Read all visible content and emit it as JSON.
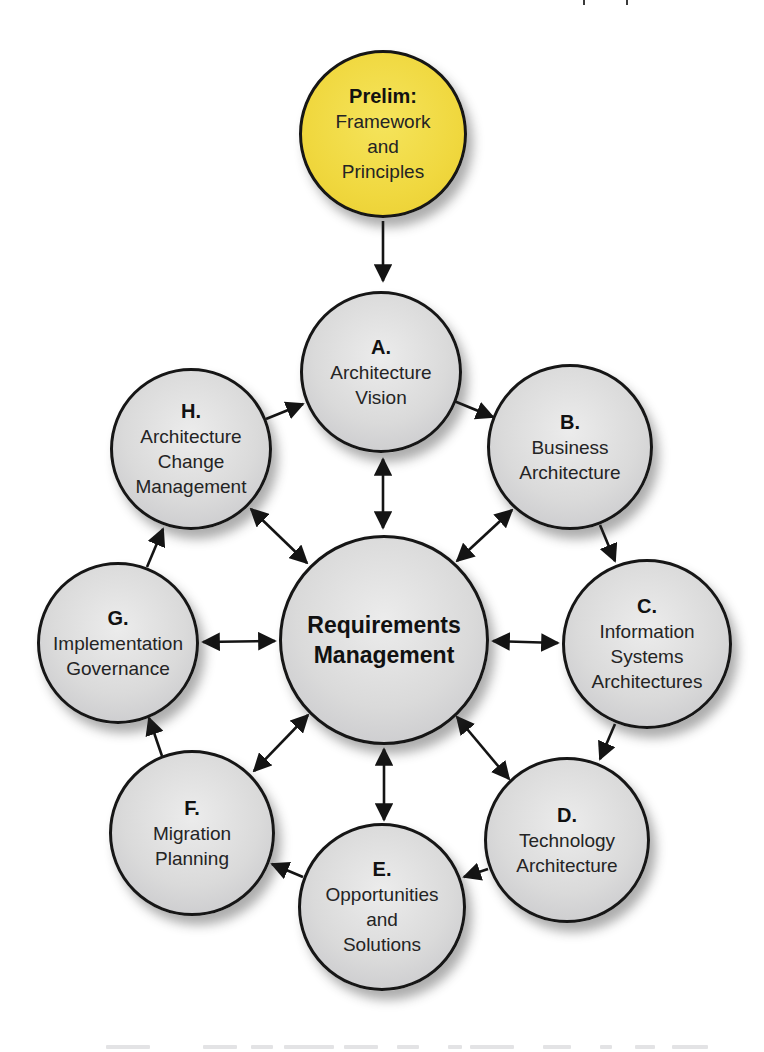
{
  "diagram": {
    "name": "Architecture Development Method cycle",
    "colors": {
      "prelim_fill": "#F0D83F",
      "phase_fill": "#D8D8D8",
      "outline": "#161616",
      "arrow": "#141414",
      "text": "#242424"
    },
    "nodes": {
      "prelim": {
        "title": "Prelim:",
        "line1": "Framework",
        "line2": "and",
        "line3": "Principles"
      },
      "a": {
        "title": "A.",
        "line1": "Architecture",
        "line2": "Vision",
        "line3": ""
      },
      "b": {
        "title": "B.",
        "line1": "Business",
        "line2": "Architecture",
        "line3": ""
      },
      "c": {
        "title": "C.",
        "line1": "Information",
        "line2": "Systems",
        "line3": "Architectures"
      },
      "d": {
        "title": "D.",
        "line1": "Technology",
        "line2": "Architecture",
        "line3": ""
      },
      "e": {
        "title": "E.",
        "line1": "Opportunities",
        "line2": "and",
        "line3": "Solutions"
      },
      "f": {
        "title": "F.",
        "line1": "Migration",
        "line2": "Planning",
        "line3": ""
      },
      "g": {
        "title": "G.",
        "line1": "Implementation",
        "line2": "Governance",
        "line3": ""
      },
      "h": {
        "title": "H.",
        "line1": "Architecture",
        "line2": "Change",
        "line3": "Management"
      },
      "center": {
        "line1": "Requirements",
        "line2": "Management"
      }
    }
  }
}
